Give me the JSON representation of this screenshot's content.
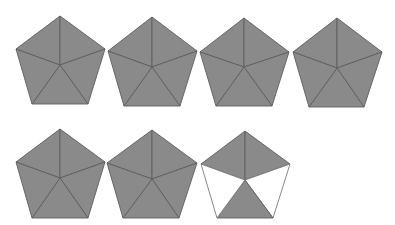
{
  "figure": {
    "colors": {
      "filled": "#8a8a8a",
      "edge": "#5e5e5e",
      "empty": "#ffffff",
      "empty_edge": "#7a7a7a"
    },
    "pentagons": [
      {
        "id": 1,
        "center": [
          60,
          65
        ],
        "top": [
          60,
          16
        ],
        "left": [
          16,
          49
        ],
        "right": [
          105,
          49
        ],
        "bl": [
          32,
          104
        ],
        "br": [
          88,
          104
        ],
        "filled": [
          true,
          true,
          true,
          true,
          true
        ]
      },
      {
        "id": 2,
        "center": [
          152,
          67
        ],
        "top": [
          152,
          17
        ],
        "left": [
          108,
          51
        ],
        "right": [
          197,
          51
        ],
        "bl": [
          124,
          106
        ],
        "br": [
          180,
          106
        ],
        "filled": [
          true,
          true,
          true,
          true,
          true
        ]
      },
      {
        "id": 3,
        "center": [
          244,
          67
        ],
        "top": [
          244,
          18
        ],
        "left": [
          200,
          52
        ],
        "right": [
          289,
          52
        ],
        "bl": [
          216,
          106
        ],
        "br": [
          272,
          106
        ],
        "filled": [
          true,
          true,
          true,
          true,
          true
        ]
      },
      {
        "id": 4,
        "center": [
          337,
          68
        ],
        "top": [
          337,
          18
        ],
        "left": [
          293,
          52
        ],
        "right": [
          382,
          52
        ],
        "bl": [
          309,
          107
        ],
        "br": [
          364,
          107
        ],
        "filled": [
          true,
          true,
          true,
          true,
          true
        ]
      },
      {
        "id": 5,
        "center": [
          60,
          178
        ],
        "top": [
          60,
          129
        ],
        "left": [
          16,
          162
        ],
        "right": [
          105,
          162
        ],
        "bl": [
          32,
          218
        ],
        "br": [
          88,
          218
        ],
        "filled": [
          true,
          true,
          true,
          true,
          true
        ]
      },
      {
        "id": 6,
        "center": [
          152,
          179
        ],
        "top": [
          152,
          130
        ],
        "left": [
          107,
          163
        ],
        "right": [
          197,
          163
        ],
        "bl": [
          123,
          218
        ],
        "br": [
          179,
          218
        ],
        "filled": [
          true,
          true,
          true,
          true,
          true
        ]
      },
      {
        "id": 7,
        "center": [
          245,
          180
        ],
        "top": [
          245,
          131
        ],
        "left": [
          201,
          164
        ],
        "right": [
          290,
          164
        ],
        "bl": [
          217,
          218
        ],
        "br": [
          273,
          218
        ],
        "filled": [
          true,
          true,
          false,
          true,
          false
        ]
      }
    ]
  }
}
